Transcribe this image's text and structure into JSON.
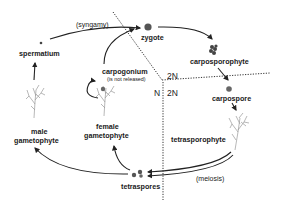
{
  "diagram": {
    "nodes": {
      "zygote": "zygote",
      "carposporophyte": "carposporophyte",
      "carpospore": "carpospore",
      "tetrasporophyte": "tetrasporophyte",
      "tetraspores": "tetraspores",
      "male_gametophyte_line1": "male",
      "male_gametophyte_line2": "gametophyte",
      "female_gametophyte_line1": "female",
      "female_gametophyte_line2": "gametophyte",
      "spermatium": "spermatium",
      "carpogonium": "carpogonium",
      "carpogonium_note": "(is not released)"
    },
    "processes": {
      "syngamy": "(syngamy)",
      "meiosis": "(meiosis)"
    },
    "ploidy_regions": {
      "top_left_of_center": "2N",
      "right_of_center": "2N",
      "left_of_center": "N"
    },
    "edges": [
      {
        "from": "spermatium",
        "to": "zygote",
        "label": "(syngamy)"
      },
      {
        "from": "carpogonium",
        "to": "zygote"
      },
      {
        "from": "zygote",
        "to": "carposporophyte"
      },
      {
        "from": "carposporophyte",
        "to": "carpospore"
      },
      {
        "from": "carpospore",
        "to": "tetrasporophyte"
      },
      {
        "from": "tetrasporophyte",
        "to": "tetraspores",
        "label": "(meiosis)"
      },
      {
        "from": "tetraspores",
        "to": "male gametophyte"
      },
      {
        "from": "tetraspores",
        "to": "female gametophyte"
      },
      {
        "from": "male gametophyte",
        "to": "spermatium"
      },
      {
        "from": "female gametophyte",
        "to": "carpogonium"
      }
    ],
    "colors": {
      "text": "#1a1a1a",
      "arrow": "#222222",
      "cell": "#555555",
      "plant": "#9a9a9a",
      "background": "#ffffff"
    }
  }
}
